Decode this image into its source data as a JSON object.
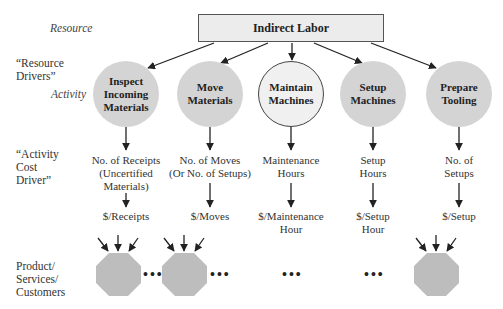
{
  "row_labels": {
    "resource": "Resource",
    "resource_drivers_1": "“Resource",
    "resource_drivers_2": "Drivers”",
    "activity": "Activity",
    "activity_cost_driver_1": "“Activity",
    "activity_cost_driver_2": "Cost",
    "activity_cost_driver_3": "Driver”",
    "products_1": "Product/",
    "products_2": "Services/",
    "products_3": "Customers"
  },
  "resource_box": {
    "label": "Indirect Labor"
  },
  "activities": [
    {
      "line1": "Inspect",
      "line2": "Incoming",
      "line3": "Materials",
      "cost_driver_1": "No. of Receipts",
      "cost_driver_2": "(Uncertified",
      "cost_driver_3": "Materials)",
      "rate_1": "$/Receipts",
      "rate_2": ""
    },
    {
      "line1": "Move",
      "line2": "Materials",
      "line3": "",
      "cost_driver_1": "No. of Moves",
      "cost_driver_2": "(Or No. of Setups)",
      "cost_driver_3": "",
      "rate_1": "$/Moves",
      "rate_2": ""
    },
    {
      "line1": "Maintain",
      "line2": "Machines",
      "line3": "",
      "cost_driver_1": "Maintenance",
      "cost_driver_2": "Hours",
      "cost_driver_3": "",
      "rate_1": "$/Maintenance",
      "rate_2": "Hour"
    },
    {
      "line1": "Setup",
      "line2": "Machines",
      "line3": "",
      "cost_driver_1": "Setup",
      "cost_driver_2": "Hours",
      "cost_driver_3": "",
      "rate_1": "$/Setup",
      "rate_2": "Hour"
    },
    {
      "line1": "Prepare",
      "line2": "Tooling",
      "line3": "",
      "cost_driver_1": "No. of",
      "cost_driver_2": "Setups",
      "cost_driver_3": "",
      "rate_1": "$/Setup",
      "rate_2": ""
    }
  ],
  "ellipsis": "•••",
  "colors": {
    "activity_fill": "#d4d4d4",
    "maintain_fill": "#f0f0f0",
    "box_fill": "#ececec",
    "octagon_fill": "#bdbdbd",
    "line": "#222222"
  }
}
